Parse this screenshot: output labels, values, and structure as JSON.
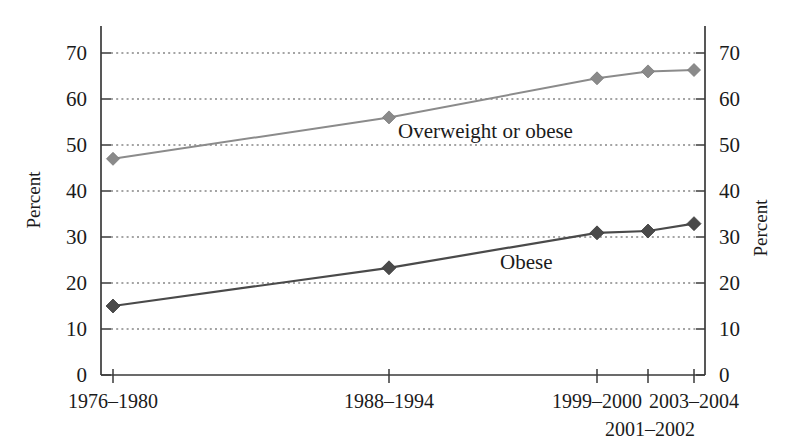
{
  "chart_data": {
    "type": "line",
    "title": "",
    "subtitle": "",
    "xlabel": "",
    "ylabel": "Percent",
    "ylabel_right": "Percent",
    "ylim": [
      0,
      75
    ],
    "yticks": [
      0,
      10,
      20,
      30,
      40,
      50,
      60,
      70
    ],
    "ytick_labels": [
      "0",
      "10",
      "20",
      "30",
      "40",
      "50",
      "60",
      "70"
    ],
    "grid": true,
    "grid_axis": "y",
    "legend_position": "inline-annotation",
    "categories": [
      "1976–1980",
      "1988–1994",
      "1999–2000",
      "2001–2002",
      "2003–2004"
    ],
    "xtick_labels_row1": [
      "1976–1980",
      "1988–1994",
      "1999–2000",
      "2003–2004"
    ],
    "xtick_labels_row2": [
      "2001–2002"
    ],
    "series": [
      {
        "name": "Overweight or obese",
        "color": "#8a8a8a",
        "marker": "diamond",
        "values": [
          47.0,
          56.0,
          64.5,
          66.0,
          66.3
        ]
      },
      {
        "name": "Obese",
        "color": "#4a4a4a",
        "marker": "diamond",
        "values": [
          15.0,
          23.3,
          30.9,
          31.3,
          32.9
        ]
      }
    ],
    "annotations": [
      {
        "text": "Overweight or obese",
        "series": "Overweight or obese"
      },
      {
        "text": "Obese",
        "series": "Obese"
      }
    ]
  },
  "axes": {
    "left_title": "Percent",
    "right_title": "Percent"
  }
}
